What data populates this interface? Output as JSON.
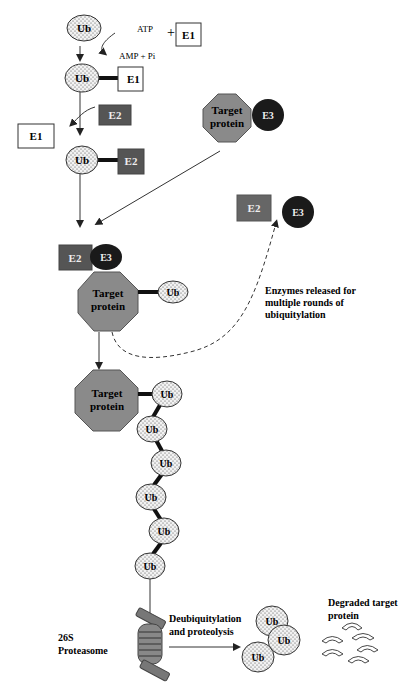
{
  "diagram": {
    "labels": {
      "ub": "Ub",
      "e1": "E1",
      "e2": "E2",
      "e3": "E3",
      "atp": "ATP",
      "plus": "+",
      "amp_pi": "AMP + Pi",
      "target_line1": "Target",
      "target_line2": "protein",
      "enzymes_released_line1": "Enzymes released for",
      "enzymes_released_line2": "multiple rounds of",
      "enzymes_released_line3": "ubiquitylation",
      "proteasome_line1": "26S",
      "proteasome_line2": "Proteasome",
      "deubiq_line1": "Deubiquitylation",
      "deubiq_line2": "and proteolysis",
      "degraded_line1": "Degraded target",
      "degraded_line2": "protein"
    },
    "colors": {
      "ub_fill": "#f0f0f0",
      "e2_fill": "#555555",
      "e3_fill": "#1a1a1a",
      "target_fill": "#8a8a8a",
      "line": "#333333"
    }
  }
}
